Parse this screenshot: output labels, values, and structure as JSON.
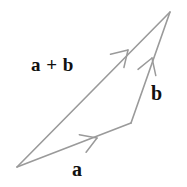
{
  "figure": {
    "type": "vector-addition-diagram",
    "width": 187,
    "height": 187,
    "background_color": "#ffffff",
    "stroke_color": "#9a9a9a",
    "label_color": "#111111",
    "stroke_width": 1.6
  },
  "labels": {
    "sum": "a + b",
    "b": "b",
    "a": "a"
  },
  "chart_data": {
    "type": "diagram",
    "title": "",
    "points": {
      "origin": [
        17,
        167
      ],
      "mid": [
        131,
        123
      ],
      "apex": [
        170,
        12
      ]
    },
    "vectors": [
      {
        "name": "a",
        "label": "a",
        "from": [
          17,
          167
        ],
        "to": [
          131,
          123
        ],
        "arrow_at": [
          97,
          138
        ],
        "label_position": [
          72,
          159
        ]
      },
      {
        "name": "b",
        "label": "b",
        "from": [
          131,
          123
        ],
        "to": [
          170,
          12
        ],
        "arrow_at": [
          152,
          58
        ],
        "label_position": [
          151,
          83
        ]
      },
      {
        "name": "a+b",
        "label": "a + b",
        "from": [
          17,
          167
        ],
        "to": [
          170,
          12
        ],
        "arrow_at": [
          128,
          50
        ],
        "label_position": [
          31,
          55
        ]
      }
    ]
  }
}
